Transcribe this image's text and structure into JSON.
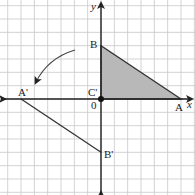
{
  "diagram": {
    "type": "coordinate-plane-rotation",
    "axes": {
      "x_label": "x",
      "y_label": "y",
      "origin_label": "0"
    },
    "grid": {
      "unit_px": 13.33,
      "origin_px": [
        101,
        99
      ],
      "x_range": [
        -7,
        7
      ],
      "y_range": [
        -7,
        7
      ],
      "line_color": "#c8c8c8"
    },
    "original_triangle": {
      "fill": "#b8b8b8",
      "stroke": "#333333",
      "vertices": [
        {
          "label": "A",
          "x": 6,
          "y": 0
        },
        {
          "label": "B",
          "x": 0,
          "y": 4
        },
        {
          "label": "C'",
          "x": 0,
          "y": 0
        }
      ]
    },
    "image_triangle": {
      "stroke": "#333333",
      "vertices": [
        {
          "label": "A'",
          "x": -6,
          "y": 0
        },
        {
          "label": "B'",
          "x": 0,
          "y": -4
        },
        {
          "label": "C'",
          "x": 0,
          "y": 0
        }
      ]
    },
    "labels": {
      "A": "A",
      "B": "B",
      "C_prime": "C'",
      "A_prime": "A'",
      "B_prime": "B'",
      "origin": "0",
      "x": "x",
      "y": "y"
    },
    "rotation_arrow": {
      "direction": "counterclockwise",
      "description": "curved arrow indicating rotation about origin"
    },
    "colors": {
      "axis": "#222222",
      "shade": "#b8b8b8",
      "grid": "#c8c8c8"
    }
  }
}
